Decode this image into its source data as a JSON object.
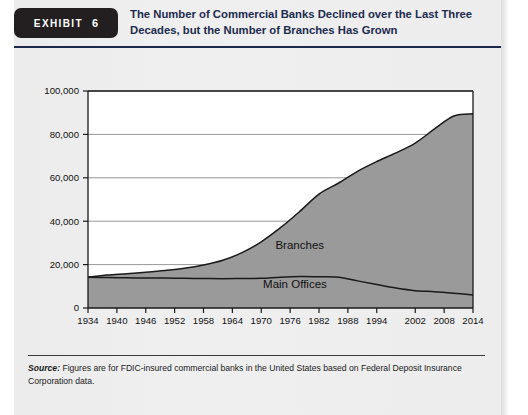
{
  "header": {
    "exhibit_word": "EXHIBIT",
    "exhibit_number": "6",
    "title": "The Number of Commercial Banks Declined over the Last Three Decades, but the Number of Branches Has Grown"
  },
  "source": {
    "label": "Source:",
    "text": " Figures are for FDIC-insured commercial banks in the United States based on Federal Deposit Insurance Corporation data."
  },
  "colors": {
    "fill_gray": "#9a9a9a",
    "line_dark": "#1a1a1a",
    "grid": "#8c8c8c",
    "axis": "#1a1a1a",
    "panel_bg": "#ededed",
    "badge_bg": "#231f20",
    "title_text": "#1d2b4e"
  },
  "chart_data": {
    "type": "area",
    "title": "The Number of Commercial Banks Declined over the Last Three Decades, but the Number of Branches Has Grown",
    "xlabel": "",
    "ylabel": "",
    "xlim": [
      1934,
      2014
    ],
    "ylim": [
      0,
      100000
    ],
    "ytick_labels": [
      "0",
      "20,000",
      "40,000",
      "60,000",
      "80,000",
      "100,000"
    ],
    "ytick_values": [
      0,
      20000,
      40000,
      60000,
      80000,
      100000
    ],
    "xtick_labels": [
      "1934",
      "1940",
      "1946",
      "1952",
      "1958",
      "1964",
      "1970",
      "1976",
      "1982",
      "1988",
      "1994",
      "2002",
      "2008",
      "2014"
    ],
    "xtick_values": [
      1934,
      1940,
      1946,
      1952,
      1958,
      1964,
      1970,
      1976,
      1982,
      1988,
      1994,
      2002,
      2008,
      2014
    ],
    "grid": true,
    "stacked": false,
    "legend": "inline-annotations",
    "annotations": [
      {
        "text": "Branches",
        "x": 1978,
        "y": 27000
      },
      {
        "text": "Main Offices",
        "x": 1977,
        "y": 9000
      }
    ],
    "x": [
      1934,
      1938,
      1942,
      1946,
      1950,
      1954,
      1958,
      1962,
      1966,
      1970,
      1974,
      1978,
      1982,
      1986,
      1990,
      1994,
      1998,
      2002,
      2006,
      2010,
      2014
    ],
    "series": [
      {
        "name": "Branches",
        "values": [
          14200,
          15200,
          15800,
          16500,
          17300,
          18300,
          19800,
          22000,
          25500,
          30500,
          37000,
          44500,
          52500,
          57500,
          63000,
          67500,
          71500,
          76000,
          82500,
          88500,
          89500
        ]
      },
      {
        "name": "Main Offices",
        "values": [
          14200,
          14000,
          13900,
          13800,
          13800,
          13700,
          13600,
          13500,
          13600,
          13700,
          14200,
          14500,
          14400,
          14200,
          12500,
          10800,
          9200,
          8000,
          7500,
          6800,
          6000
        ]
      }
    ]
  }
}
